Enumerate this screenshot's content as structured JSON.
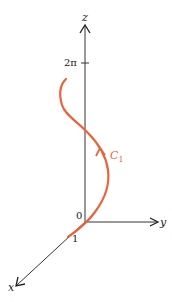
{
  "figure": {
    "type": "3D helix curve diagram",
    "axes": {
      "x_label": "x",
      "y_label": "y",
      "z_label": "z"
    },
    "ticks": {
      "origin": "0",
      "x_tick": "1",
      "z_tick": "2π"
    },
    "curve": {
      "label": "C",
      "subscript": "1",
      "color": "#E8643C"
    },
    "colors": {
      "axis": "#222222",
      "background": "#ffffff"
    }
  }
}
